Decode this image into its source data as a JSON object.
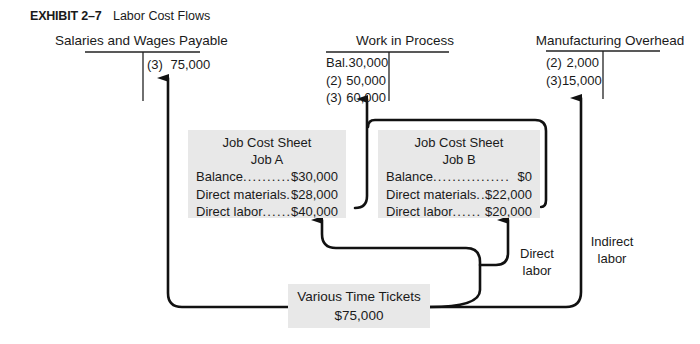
{
  "exhibit": {
    "number": "EXHIBIT 2–7",
    "title": "Labor Cost Flows"
  },
  "accounts": [
    {
      "name": "Salaries and Wages Payable",
      "debits": [],
      "credits": [
        {
          "ref": "(3)",
          "amount": "75,000"
        }
      ]
    },
    {
      "name": "Work in Process",
      "debits": [
        {
          "ref": "Bal.",
          "amount": "30,000"
        },
        {
          "ref": "(2)",
          "amount": "50,000"
        },
        {
          "ref": "(3)",
          "amount": "60,000"
        }
      ],
      "credits": []
    },
    {
      "name": "Manufacturing Overhead",
      "debits": [
        {
          "ref": "(2)",
          "amount": "2,000"
        },
        {
          "ref": "(3)",
          "amount": "15,000"
        }
      ],
      "credits": []
    }
  ],
  "job_cost_sheets": [
    {
      "title": "Job Cost Sheet",
      "job": "Job A",
      "rows": [
        {
          "label": "Balance",
          "dots": "..........",
          "value": "$30,000"
        },
        {
          "label": "Direct materials",
          "dots": "...",
          "value": "$28,000"
        },
        {
          "label": "Direct labor",
          "dots": "......",
          "value": "$40,000"
        }
      ]
    },
    {
      "title": "Job Cost Sheet",
      "job": "Job B",
      "rows": [
        {
          "label": "Balance",
          "dots": "................",
          "value": "$0"
        },
        {
          "label": "Direct materials",
          "dots": "...",
          "value": "$22,000"
        },
        {
          "label": "Direct labor",
          "dots": "......",
          "value": "$20,000"
        }
      ]
    }
  ],
  "time_tickets": {
    "title": "Various Time Tickets",
    "amount": "$75,000"
  },
  "flow_labels": {
    "direct": [
      "Direct",
      "labor"
    ],
    "indirect": [
      "Indirect",
      "labor"
    ]
  },
  "colors": {
    "line": "#111111",
    "box_fill": "#e8e8e8",
    "text": "#1a1a1a"
  }
}
